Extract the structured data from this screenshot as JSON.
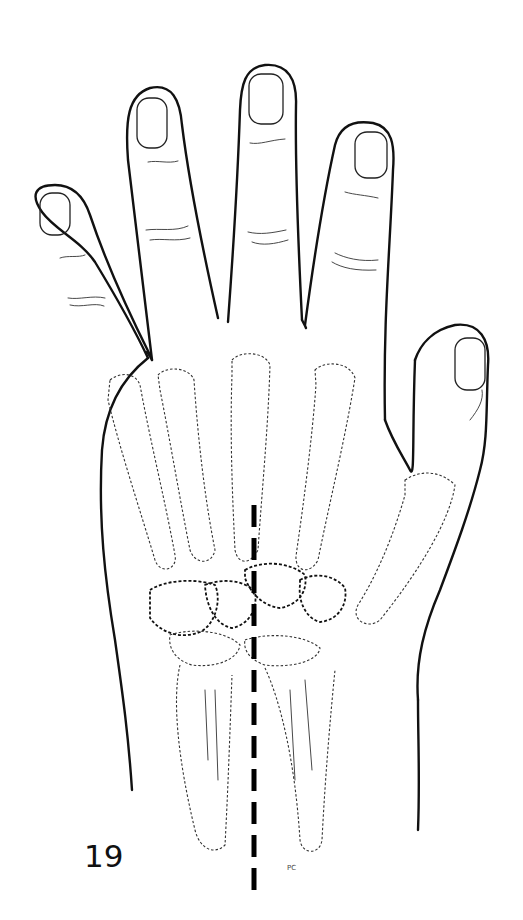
{
  "figure": {
    "number": "19",
    "signature": "PC",
    "colors": {
      "background": "#ffffff",
      "ink": "#111111",
      "axis_line": "#000000"
    }
  }
}
